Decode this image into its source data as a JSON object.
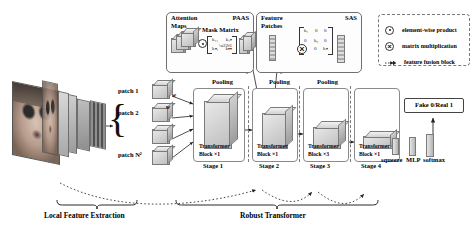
{
  "figure": {
    "background": "#ffffff",
    "ink": "#111111"
  },
  "modules": {
    "paas": {
      "label": "PAAS",
      "attention_maps_label": "Attention\nMaps",
      "attention_maps_line1": "Attention",
      "attention_maps_line2": "Maps",
      "mask_matrix_label": "Mask Matrix",
      "operator": "element-wise-product",
      "operator_glyph": "⊙",
      "matrix_entries": [
        "k₁₁",
        "k₁ₙ",
        "kₙ₁",
        "kₙₙ"
      ]
    },
    "sas": {
      "label": "SAS",
      "feature_patches_line1": "Feature",
      "feature_patches_line2": "Patches",
      "operator": "matrix-multiplication",
      "operator_glyph": "⊗",
      "matrix_entries": [
        "k₁",
        "0",
        "0",
        "0",
        "k₂",
        "0",
        "0",
        "0",
        "kₙ"
      ]
    }
  },
  "legend": {
    "items": [
      {
        "glyph": "⊙",
        "icon": "element-wise-product-icon",
        "label": "element-wise product"
      },
      {
        "glyph": "⊗",
        "icon": "matrix-multiplication-icon",
        "label": "matrix multiplication"
      },
      {
        "glyph": "⇢",
        "icon": "dashed-arrow-icon",
        "label": "feature fusion block"
      }
    ]
  },
  "patches": {
    "items": [
      {
        "label": "patch 1",
        "weight": "w"
      },
      {
        "label": "patch 2",
        "weight": "w"
      },
      {
        "label": "patch N²",
        "weight": ""
      }
    ]
  },
  "pooling": {
    "label": "Pooling",
    "count": 3
  },
  "stages": [
    {
      "name": "Stage 1",
      "block_label": "Transformer",
      "block_count": "Block ×1"
    },
    {
      "name": "Stage 2",
      "block_label": "Transformer",
      "block_count": "Block ×1"
    },
    {
      "name": "Stage 3",
      "block_label": "Transformer",
      "block_count": "Block ×3"
    },
    {
      "name": "Stage 4",
      "block_label": "Transformer",
      "block_count": "Block ×1"
    }
  ],
  "head": {
    "steps": [
      "squeeze",
      "MLP",
      "softmax"
    ],
    "output_label": "Fake 0/Real 1"
  },
  "captions": {
    "left": "Local Feature Extraction",
    "right": "Robust  Transformer"
  }
}
